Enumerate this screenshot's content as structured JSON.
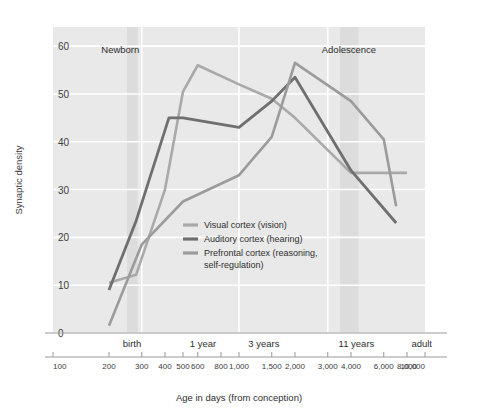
{
  "chart_data": {
    "type": "line",
    "title": "",
    "xlabel": "Age in days (from conception)",
    "ylabel": "Synaptic density",
    "xscale": "log",
    "xlim": [
      100,
      10000
    ],
    "ylim": [
      0,
      64
    ],
    "grid": true,
    "legend_position": "inside-center",
    "y_ticks": [
      "0",
      "10",
      "20",
      "30",
      "40",
      "50",
      "60"
    ],
    "y_tick_values": [
      0,
      10,
      20,
      30,
      40,
      50,
      60
    ],
    "x_ticks": [
      "100",
      "200",
      "300",
      "400",
      "500",
      "600",
      "800",
      "1,000",
      "1,500",
      "2,000",
      "3,000",
      "4,000",
      "6,000",
      "8,000",
      "10,000"
    ],
    "x_tick_values": [
      100,
      200,
      300,
      400,
      500,
      600,
      800,
      1000,
      1500,
      2000,
      3000,
      4000,
      6000,
      8000,
      10000
    ],
    "x_category_labels": [
      {
        "label": "birth",
        "value": 266
      },
      {
        "label": "1 year",
        "value": 640
      },
      {
        "label": "3 years",
        "value": 1360
      },
      {
        "label": "11 years",
        "value": 4280
      },
      {
        "label": "adult",
        "value": 9600
      }
    ],
    "annotations": [
      {
        "label": "Newborn",
        "value": 230
      },
      {
        "label": "Adolescence",
        "value": 3900
      }
    ],
    "highlight_bands": [
      {
        "name": "birth-band",
        "from": 250,
        "to": 285
      },
      {
        "name": "adolescence-band",
        "from": 3500,
        "to": 4400
      }
    ],
    "gridlines_x": [
      300,
      1000,
      3000
    ],
    "series": [
      {
        "name": "Visual cortex (vision)",
        "color": "#a9a9a9",
        "width": 2.6,
        "x": [
          200,
          280,
          400,
          500,
          600,
          1000,
          1500,
          2000,
          4000,
          6000,
          8000
        ],
        "y": [
          10.5,
          12.2,
          30.0,
          50.5,
          56.0,
          52.0,
          49.0,
          45.0,
          33.5,
          33.5,
          33.5
        ]
      },
      {
        "name": "Auditory cortex (hearing)",
        "color": "#6f6f6f",
        "width": 2.8,
        "x": [
          200,
          280,
          420,
          500,
          1000,
          1500,
          2000,
          4000,
          7000
        ],
        "y": [
          9.0,
          23.5,
          45.0,
          45.0,
          43.0,
          48.5,
          53.5,
          34.0,
          23.0
        ]
      },
      {
        "name": "Prefrontal cortex (reasoning, self-regulation)",
        "color": "#9b9b9b",
        "width": 2.6,
        "x": [
          200,
          300,
          500,
          1000,
          1500,
          2000,
          4000,
          6000,
          7000
        ],
        "y": [
          1.5,
          18.5,
          27.5,
          33.0,
          41.0,
          56.5,
          48.5,
          40.5,
          26.5
        ]
      }
    ],
    "legend": [
      {
        "label": "Visual cortex (vision)",
        "color": "#a9a9a9"
      },
      {
        "label": "Auditory cortex (hearing)",
        "color": "#6f6f6f"
      },
      {
        "label": "Prefrontal cortex (reasoning,",
        "label2": "self-regulation)",
        "color": "#9b9b9b"
      }
    ]
  },
  "style": {
    "plot_bg": "#e9e9e9",
    "grid_color": "#ffffff",
    "band_color": "#dcdcdc",
    "axis_color": "#9a9a9a",
    "text_color": "#3b3b3b"
  }
}
